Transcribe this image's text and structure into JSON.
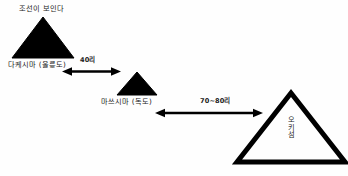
{
  "diagram": {
    "title_note": "조선이 보인다",
    "background_color": "#fefefe",
    "ink_color": "#000000",
    "labels": {
      "korea_visible": "조선이 보인다",
      "takeshima": "다케시마 (울릉도)",
      "matsushima": "마쓰시마 (독도)",
      "oki": "오키섬"
    },
    "distances": {
      "takeshima_to_matsushima": "40리",
      "matsushima_to_oki": "70~80리"
    },
    "islands": [
      {
        "name": "takeshima",
        "label": "다케시마 (울릉도)",
        "shape": "triangle",
        "fill": "solid",
        "size": "large"
      },
      {
        "name": "matsushima",
        "label": "마쓰시마 (독도)",
        "shape": "triangle",
        "fill": "solid",
        "size": "small"
      },
      {
        "name": "oki",
        "label": "오키섬",
        "shape": "triangle",
        "fill": "outline",
        "size": "large"
      }
    ],
    "connectors": [
      {
        "name": "arrow-takeshima-matsushima",
        "label": "40리",
        "style": "double-headed"
      },
      {
        "name": "arrow-matsushima-oki",
        "label": "70~80리",
        "style": "double-headed"
      }
    ]
  }
}
